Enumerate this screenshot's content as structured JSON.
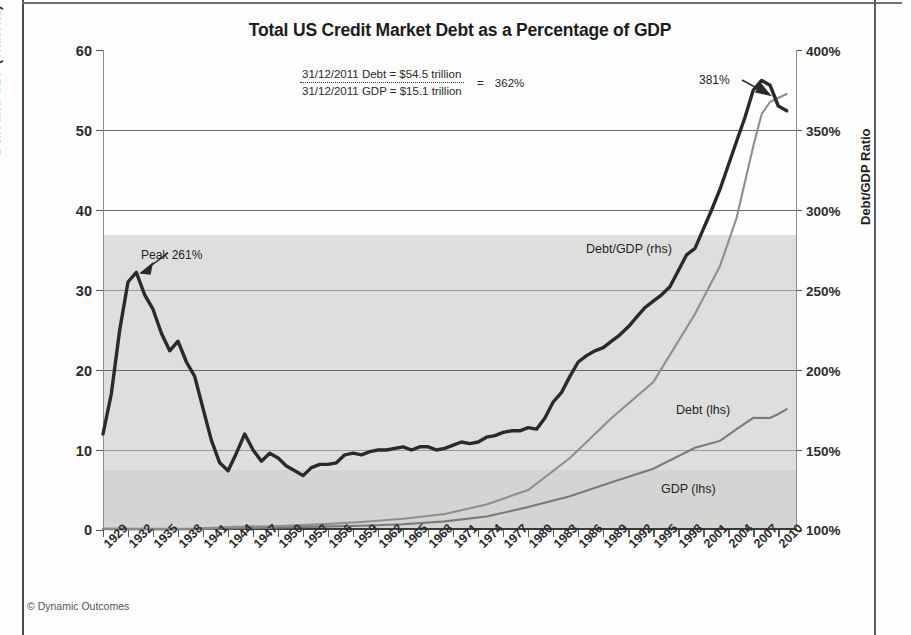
{
  "chart_data": {
    "type": "line",
    "title": "Total US Credit Market Debt as a Percentage of GDP",
    "xlabel": "",
    "ylabel_left": "Debt and GDP (Trillions)",
    "ylabel_right": "Debt/GDP Ratio",
    "ylim_left": [
      0,
      60
    ],
    "ylim_right": [
      100,
      400
    ],
    "yticks_left": [
      "60",
      "50",
      "40",
      "30",
      "20",
      "10",
      "0"
    ],
    "yticks_right": [
      "400%",
      "350%",
      "300%",
      "250%",
      "200%",
      "150%",
      "100%"
    ],
    "grid": true,
    "legend_position": "inline-annotations",
    "x_range": [
      1929,
      2012
    ],
    "xtick_labels": [
      "1929",
      "1932",
      "1935",
      "1938",
      "1941",
      "1944",
      "1947",
      "1950",
      "1953",
      "1956",
      "1959",
      "1962",
      "1965",
      "1968",
      "1971",
      "1974",
      "1977",
      "1980",
      "1983",
      "1986",
      "1989",
      "1992",
      "1995",
      "1998",
      "2001",
      "2004",
      "2007",
      "2010"
    ],
    "series": [
      {
        "name": "Debt/GDP (rhs)",
        "axis": "right",
        "unit": "%",
        "color": "#2a2a2a",
        "x": [
          1929,
          1930,
          1931,
          1932,
          1933,
          1934,
          1935,
          1936,
          1937,
          1938,
          1939,
          1940,
          1941,
          1942,
          1943,
          1944,
          1945,
          1946,
          1947,
          1948,
          1949,
          1950,
          1951,
          1952,
          1953,
          1954,
          1955,
          1956,
          1957,
          1958,
          1959,
          1960,
          1961,
          1962,
          1963,
          1964,
          1965,
          1966,
          1967,
          1968,
          1969,
          1970,
          1971,
          1972,
          1973,
          1974,
          1975,
          1976,
          1977,
          1978,
          1979,
          1980,
          1981,
          1982,
          1983,
          1984,
          1985,
          1986,
          1987,
          1988,
          1989,
          1990,
          1991,
          1992,
          1993,
          1994,
          1995,
          1996,
          1997,
          1998,
          1999,
          2000,
          2001,
          2002,
          2003,
          2004,
          2005,
          2006,
          2007,
          2008,
          2009,
          2010,
          2011
        ],
        "values": [
          160,
          185,
          225,
          255,
          261,
          247,
          238,
          223,
          212,
          218,
          205,
          196,
          176,
          156,
          142,
          137,
          148,
          160,
          150,
          143,
          148,
          145,
          140,
          137,
          134,
          139,
          141,
          141,
          142,
          147,
          148,
          147,
          149,
          150,
          150,
          151,
          152,
          150,
          152,
          152,
          150,
          151,
          153,
          155,
          154,
          155,
          158,
          159,
          161,
          162,
          162,
          164,
          163,
          170,
          180,
          186,
          196,
          205,
          209,
          212,
          214,
          218,
          222,
          227,
          233,
          239,
          243,
          247,
          252,
          262,
          272,
          276,
          288,
          300,
          313,
          328,
          343,
          358,
          375,
          381,
          378,
          365,
          362
        ]
      },
      {
        "name": "Debt (lhs)",
        "axis": "left",
        "unit": "trillions",
        "color": "#8e8e8e",
        "x": [
          1929,
          1935,
          1940,
          1945,
          1950,
          1955,
          1960,
          1965,
          1970,
          1975,
          1980,
          1985,
          1990,
          1995,
          2000,
          2003,
          2005,
          2007,
          2008,
          2009,
          2010,
          2011
        ],
        "values": [
          0.17,
          0.15,
          0.19,
          0.4,
          0.5,
          0.7,
          1.0,
          1.4,
          2.0,
          3.2,
          5.0,
          9.0,
          14.0,
          18.5,
          27.0,
          33.0,
          39.0,
          48.0,
          52.0,
          53.5,
          54.0,
          54.5
        ]
      },
      {
        "name": "GDP (lhs)",
        "axis": "left",
        "unit": "trillions",
        "color": "#7a7a7a",
        "x": [
          1929,
          1935,
          1940,
          1945,
          1950,
          1955,
          1960,
          1965,
          1970,
          1975,
          1980,
          1985,
          1990,
          1995,
          2000,
          2003,
          2005,
          2007,
          2009,
          2010,
          2011
        ],
        "values": [
          0.1,
          0.07,
          0.1,
          0.23,
          0.3,
          0.42,
          0.54,
          0.72,
          1.08,
          1.69,
          2.86,
          4.22,
          5.98,
          7.66,
          10.28,
          11.14,
          12.6,
          14.03,
          14.0,
          14.5,
          15.1
        ]
      }
    ],
    "annotations": [
      {
        "name": "peak-261",
        "text": "Peak 261%",
        "points_to_year": 1933,
        "points_to_value": "261%"
      },
      {
        "name": "peak-381",
        "text": "381%",
        "points_to_year": 2008,
        "points_to_value": "381%"
      },
      {
        "name": "debtgdp-series-label",
        "text": "Debt/GDP (rhs)"
      },
      {
        "name": "debt-series-label",
        "text": "Debt (lhs)"
      },
      {
        "name": "gdp-series-label",
        "text": "GDP (lhs)"
      }
    ],
    "calc_box": {
      "numerator": "31/12/2011 Debt  = $54.5 trillion",
      "denominator": "31/12/2011 GDP  = $15.1 trillion",
      "equals": "=",
      "result": "362%"
    }
  },
  "footer": {
    "copyright": "© Dynamic Outcomes"
  }
}
